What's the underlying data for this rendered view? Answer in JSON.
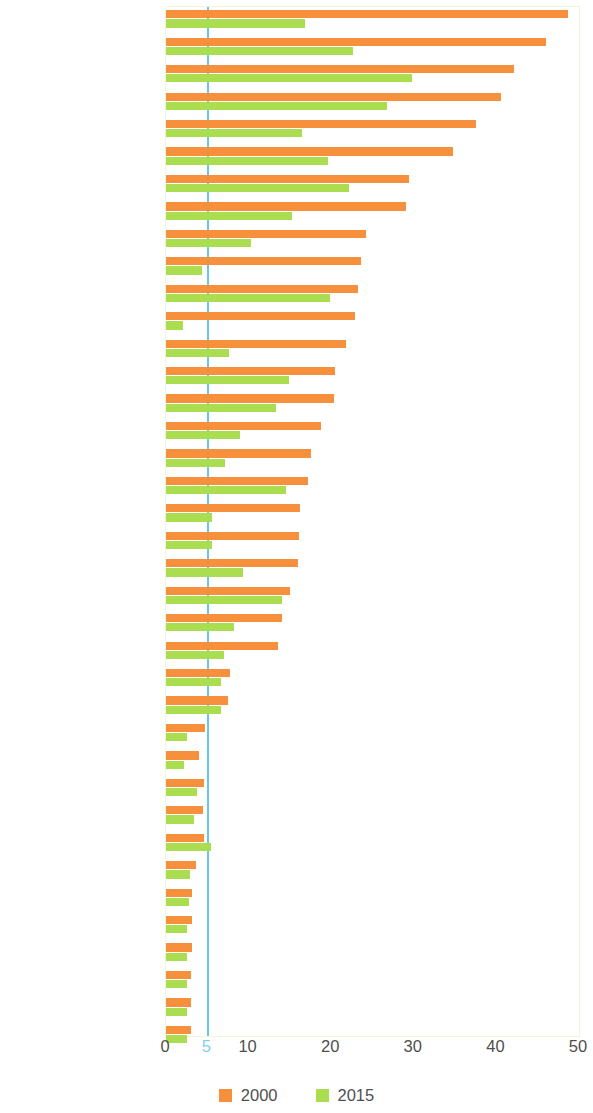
{
  "chart_data": {
    "type": "bar",
    "orientation": "horizontal",
    "title": "",
    "xlabel": "",
    "ylabel": "",
    "xlim": [
      0,
      50
    ],
    "xticks": [
      0,
      5,
      10,
      20,
      30,
      40,
      50
    ],
    "xtick_labels": [
      "0",
      "5",
      "10",
      "20",
      "30",
      "40",
      "50"
    ],
    "highlight_line": 5,
    "highlight_line_color": "#67c7e8",
    "grid": false,
    "legend_position": "bottom",
    "colors": {
      "2000": "#f7903d",
      "2015": "#aadd50"
    },
    "series": [
      {
        "name": "2000",
        "color": "#f7903d",
        "values": [
          48.7,
          46.0,
          42.1,
          40.5,
          37.5,
          34.7,
          29.4,
          29.0,
          24.2,
          23.6,
          23.2,
          22.9,
          21.8,
          20.4,
          20.3,
          18.8,
          17.5,
          17.2,
          16.2,
          16.1,
          16.0,
          15.0,
          14.0,
          13.5,
          7.7,
          7.5,
          4.7,
          4.0,
          4.6,
          4.5,
          4.6,
          3.6,
          3.2,
          3.1,
          3.1,
          3.0,
          3.0,
          3.0
        ]
      },
      {
        "name": "2015",
        "color": "#aadd50",
        "values": [
          16.8,
          22.6,
          29.8,
          26.8,
          16.5,
          19.6,
          22.1,
          15.3,
          10.3,
          4.3,
          19.9,
          2.1,
          7.6,
          14.9,
          13.3,
          9.0,
          7.2,
          14.5,
          5.6,
          5.6,
          9.3,
          14.1,
          8.2,
          7.0,
          6.6,
          6.6,
          2.6,
          2.2,
          3.8,
          3.4,
          5.5,
          2.9,
          2.8,
          2.6,
          2.6,
          2.6,
          2.6,
          2.5
        ]
      }
    ],
    "categories": [
      "Myanmar",
      "Afghanistan",
      "Tajikistan",
      "Timor-Leste",
      "Lao PDR",
      "Mongolia",
      "Sri Lanka",
      "Cambodia",
      "Viet Nam",
      "Armenia",
      "Pakistan",
      "Azerbaijan",
      "Nepal",
      "Bangladesh",
      "Philippines",
      "Thailand",
      "Indonesia",
      "India",
      "Uzbekistan",
      "Kyrgyz Republic",
      "PRC",
      "Solomon Islands",
      "Maldives",
      "Georgia",
      "Turkmenistan",
      "Vanuatu",
      "Kazakhstan",
      "Samoa",
      "Fiji",
      "Kiribati",
      "Taipei,China",
      "Brunei Darussalam",
      "Malaysia",
      "Republic of Korea",
      "Australia",
      "Japan",
      "New Zealand",
      "Hong Kong, China"
    ]
  },
  "legend": {
    "items": [
      {
        "label": "2000",
        "color": "#f7903d"
      },
      {
        "label": "2015",
        "color": "#aadd50"
      }
    ]
  }
}
